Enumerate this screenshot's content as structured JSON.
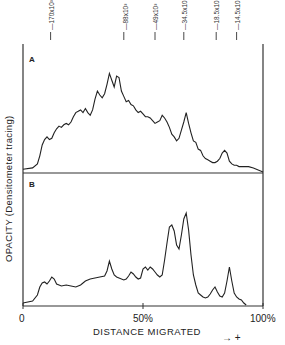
{
  "chart_data": {
    "type": "line",
    "title": "",
    "xlabel": "DISTANCE MIGRATED",
    "ylabel": "OPACITY (Densitometer tracing)",
    "direction_annotation": "→ +",
    "x_ticks": [
      {
        "value": 0,
        "label": "0"
      },
      {
        "value": 50,
        "label": "50%"
      },
      {
        "value": 100,
        "label": "100%"
      }
    ],
    "xlim": [
      0,
      100
    ],
    "grid": false,
    "legend": null,
    "molecular_weight_markers": [
      {
        "label": "170x10³",
        "x": 11.5
      },
      {
        "label": "88x10³",
        "x": 42
      },
      {
        "label": "49x10³",
        "x": 55
      },
      {
        "label": "34.5x10³",
        "x": 67
      },
      {
        "label": "18.5x10³",
        "x": 80.5
      },
      {
        "label": "14.5x10³",
        "x": 89
      }
    ],
    "panels": [
      {
        "name": "A",
        "x": [
          0,
          4,
          6,
          7,
          8,
          9,
          10,
          11,
          12,
          13,
          14,
          15,
          16,
          17,
          18,
          19,
          20,
          21,
          22,
          23,
          24,
          25,
          26,
          27,
          28,
          29,
          30,
          31,
          32,
          33,
          34,
          35,
          36,
          37,
          38,
          39,
          40,
          41,
          42,
          43,
          44,
          45,
          46,
          47,
          48,
          49,
          50,
          51,
          52,
          53,
          54,
          55,
          56,
          57,
          58,
          59,
          60,
          61,
          62,
          63,
          64,
          65,
          66,
          67,
          68,
          69,
          70,
          71,
          72,
          73,
          74,
          75,
          76,
          77,
          78,
          79,
          80,
          81,
          82,
          83,
          84,
          85,
          86,
          87,
          88,
          89,
          90,
          92,
          94,
          96,
          100
        ],
        "y": [
          2,
          3,
          6,
          12,
          20,
          24,
          26,
          24,
          25,
          29,
          32,
          34,
          33,
          35,
          36,
          35,
          37,
          41,
          44,
          45,
          46,
          44,
          47,
          44,
          42,
          46,
          54,
          60,
          57,
          55,
          58,
          65,
          73,
          68,
          63,
          71,
          70,
          60,
          56,
          52,
          53,
          50,
          49,
          46,
          44,
          45,
          43,
          41,
          41,
          40,
          38,
          36,
          37,
          38,
          42,
          40,
          37,
          33,
          28,
          26,
          23,
          25,
          31,
          37,
          44,
          36,
          29,
          23,
          22,
          17,
          16,
          12,
          10,
          9,
          8,
          7,
          7,
          8,
          10,
          14,
          16,
          14,
          8,
          6,
          5,
          5,
          4,
          4,
          4,
          3,
          0
        ]
      },
      {
        "name": "B",
        "x": [
          0,
          4,
          6,
          7,
          8,
          9,
          10,
          11,
          12,
          13,
          14,
          15,
          16,
          18,
          20,
          22,
          24,
          26,
          28,
          30,
          32,
          34,
          35,
          36,
          37,
          38,
          39,
          40,
          42,
          43,
          44,
          45,
          46,
          47,
          48,
          49,
          50,
          51,
          52,
          53,
          54,
          55,
          56,
          57,
          58,
          59,
          60,
          61,
          62,
          63,
          64,
          65,
          66,
          67,
          68,
          69,
          70,
          71,
          72,
          73,
          74,
          75,
          76,
          77,
          78,
          79,
          80,
          81,
          82,
          83,
          84,
          85,
          86,
          87,
          88,
          89,
          90,
          91,
          92,
          93
        ],
        "y": [
          2,
          4,
          10,
          18,
          22,
          23,
          21,
          24,
          28,
          26,
          21,
          20,
          19,
          20,
          19,
          18,
          20,
          24,
          26,
          27,
          28,
          29,
          34,
          44,
          36,
          30,
          28,
          27,
          25,
          26,
          29,
          33,
          31,
          28,
          26,
          27,
          36,
          38,
          35,
          38,
          36,
          33,
          30,
          28,
          30,
          45,
          62,
          78,
          80,
          74,
          60,
          56,
          70,
          86,
          92,
          75,
          50,
          30,
          20,
          12,
          10,
          8,
          7,
          8,
          11,
          15,
          18,
          13,
          9,
          8,
          12,
          24,
          38,
          24,
          12,
          8,
          6,
          5,
          2,
          0
        ]
      }
    ]
  },
  "panels": {
    "a_label": "A",
    "b_label": "B"
  },
  "axes": {
    "x_tick_0": "0",
    "x_tick_50": "50%",
    "x_tick_100": "100%",
    "xlabel": "DISTANCE MIGRATED",
    "ylabel": "OPACITY (Densitometer tracing)",
    "direction": "→  +"
  },
  "markers": {
    "m170": "170x10³",
    "m88": "88x10³",
    "m49": "49x10³",
    "m34": "34.5x10³",
    "m18": "18.5x10³",
    "m14": "14.5x10³"
  },
  "colors": {
    "line": "#222222",
    "frame": "#333333",
    "background": "#ffffff"
  }
}
